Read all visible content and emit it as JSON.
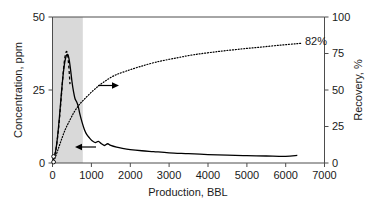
{
  "chart_data": {
    "type": "line",
    "title": "",
    "xlabel": "Production, BBL",
    "ylabel": "Concentration, ppm",
    "y2label": "Recovery, %",
    "xlim": [
      0,
      7000
    ],
    "ylim": [
      0,
      50
    ],
    "y2lim": [
      0,
      100
    ],
    "grid": false,
    "legend": "none",
    "xticks": [
      0,
      1000,
      2000,
      3000,
      4000,
      5000,
      6000,
      7000
    ],
    "xtick_labels": [
      "0",
      "1000",
      "2000",
      "3000",
      "4000",
      "5000",
      "6000",
      "7000"
    ],
    "yticks": [
      0,
      25,
      50
    ],
    "ytick_labels": [
      "0",
      "25",
      "50"
    ],
    "y2ticks": [
      0,
      25,
      50,
      75,
      100
    ],
    "y2tick_labels": [
      "0",
      "25",
      "50",
      "75",
      "100"
    ],
    "shaded_band": {
      "x_start": 0,
      "x_end": 780,
      "color": "#d9d9d9"
    },
    "series": [
      {
        "name": "concentration-dashed",
        "style": "dashed",
        "axis": "left",
        "x": [
          20,
          45,
          70,
          95,
          120,
          150,
          180,
          210,
          240,
          270,
          300,
          330,
          360,
          390,
          420,
          450
        ],
        "y": [
          1.0,
          2.0,
          3.4,
          5.2,
          7.6,
          11.0,
          15.2,
          20.0,
          25.0,
          30.0,
          34.2,
          37.0,
          38.2,
          37.0,
          33.0,
          27.0
        ]
      },
      {
        "name": "concentration-solid",
        "style": "solid",
        "axis": "left",
        "x": [
          30,
          80,
          130,
          180,
          230,
          280,
          330,
          380,
          420,
          460,
          500,
          540,
          580,
          620,
          660,
          700,
          760,
          820,
          880,
          950,
          1020,
          1100,
          1180,
          1260,
          1340,
          1420,
          1500,
          1650,
          1800,
          2000,
          2300,
          2600,
          3000,
          3500,
          4000,
          4500,
          5000,
          5500,
          6000,
          6300
        ],
        "y": [
          1.5,
          4.0,
          9.0,
          16.0,
          24.0,
          31.0,
          35.5,
          37.2,
          36.0,
          32.5,
          28.0,
          24.5,
          22.0,
          21.0,
          19.5,
          17.0,
          14.0,
          11.5,
          9.8,
          8.6,
          7.6,
          7.0,
          7.4,
          6.6,
          6.0,
          6.6,
          6.0,
          5.4,
          5.0,
          4.6,
          4.2,
          3.9,
          3.5,
          3.2,
          2.9,
          2.7,
          2.5,
          2.4,
          2.3,
          2.6
        ]
      },
      {
        "name": "recovery-dotted",
        "style": "dotted",
        "axis": "right",
        "x": [
          60,
          140,
          230,
          330,
          440,
          560,
          690,
          830,
          980,
          1150,
          1350,
          1600,
          1900,
          2250,
          2650,
          3100,
          3600,
          4150,
          4750,
          5400,
          6050,
          6400
        ],
        "y": [
          3,
          9,
          16,
          23,
          29,
          35,
          40,
          44,
          48,
          52,
          56,
          60,
          63,
          66,
          69,
          71.5,
          74,
          76,
          77.8,
          79.5,
          81.2,
          82
        ]
      }
    ],
    "annotations": [
      {
        "name": "recovery-value-label",
        "text": "82%",
        "x": 6450,
        "y2": 84
      },
      {
        "name": "recovery-axis-arrow",
        "text": "",
        "direction": "right"
      },
      {
        "name": "concentration-axis-arrow",
        "text": "",
        "direction": "left"
      }
    ]
  }
}
